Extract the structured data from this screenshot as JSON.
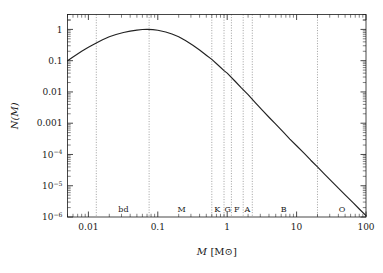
{
  "figure": {
    "name": "stellar-initial-mass-function",
    "background_color": "#ffffff",
    "frame_color": "#1a1a1a",
    "curve_color": "#222222",
    "grid_color": "#777777"
  },
  "axes": {
    "x": {
      "title_symbol": "M",
      "title_unit": "[M⊙]",
      "title_full": "M [M⊙]",
      "scale": "log",
      "min": 0.005,
      "max": 100,
      "tick_labels": [
        "0.01",
        "0.1",
        "1",
        "10",
        "100"
      ],
      "tick_values": [
        0.01,
        0.1,
        1,
        10,
        100
      ]
    },
    "y": {
      "title_full": "N(M)",
      "scale": "log",
      "min": 1e-06,
      "max": 3.0,
      "tick_labels": [
        "1",
        "0.1",
        "0.01",
        "0.001",
        "10−4",
        "10−5",
        "10−6"
      ],
      "tick_values": [
        1,
        0.1,
        0.01,
        0.001,
        0.0001,
        1e-05,
        1e-06
      ],
      "tick_label_parts": [
        {
          "mantissa": "1",
          "exponent": ""
        },
        {
          "mantissa": "0.1",
          "exponent": ""
        },
        {
          "mantissa": "0.01",
          "exponent": ""
        },
        {
          "mantissa": "0.001",
          "exponent": ""
        },
        {
          "mantissa": "10",
          "exponent": "−4"
        },
        {
          "mantissa": "10",
          "exponent": "−5"
        },
        {
          "mantissa": "10",
          "exponent": "−6"
        }
      ]
    }
  },
  "spectral_classes": {
    "labels": [
      "bd",
      "M",
      "K",
      "G",
      "F",
      "A",
      "B",
      "O"
    ],
    "label_mass_positions": [
      0.032,
      0.22,
      0.72,
      1.02,
      1.38,
      1.95,
      6.5,
      45
    ],
    "boundary_masses": [
      0.013,
      0.075,
      0.6,
      0.9,
      1.15,
      1.7,
      2.3,
      20.0
    ],
    "label_y_value": 1.1e-06
  },
  "chart_data": {
    "type": "line",
    "title": "",
    "xlabel": "M [M⊙]",
    "ylabel": "N(M)",
    "xscale": "log",
    "yscale": "log",
    "xlim": [
      0.005,
      100
    ],
    "ylim": [
      1e-06,
      3.0
    ],
    "grid": "vertical-dotted-spectral-class-boundaries",
    "legend": "none",
    "series": [
      {
        "name": "N(M)",
        "description": "lognormal below 1 solar mass, Salpeter power-law slope -2.35 above",
        "peak_mass": 0.07,
        "peak_value": 1.0,
        "powerlaw_slope": -2.35,
        "x": [
          0.005,
          0.006,
          0.008,
          0.01,
          0.013,
          0.016,
          0.02,
          0.025,
          0.032,
          0.04,
          0.05,
          0.06,
          0.07,
          0.085,
          0.1,
          0.13,
          0.16,
          0.2,
          0.25,
          0.32,
          0.4,
          0.5,
          0.6,
          0.75,
          0.9,
          1.0,
          1.3,
          1.6,
          2.0,
          2.5,
          3.2,
          4.0,
          5.0,
          6.5,
          8.0,
          10.0,
          13.0,
          16.0,
          20.0,
          25.0,
          32.0,
          40.0,
          50.0,
          65.0,
          80.0,
          100.0
        ],
        "y": [
          0.1,
          0.132,
          0.2,
          0.27,
          0.37,
          0.47,
          0.58,
          0.69,
          0.8,
          0.88,
          0.95,
          0.99,
          1.0,
          0.98,
          0.94,
          0.83,
          0.71,
          0.58,
          0.44,
          0.31,
          0.22,
          0.15,
          0.11,
          0.07,
          0.048,
          0.04,
          0.022,
          0.0135,
          0.0082,
          0.0047,
          0.0026,
          0.00155,
          0.00093,
          0.00051,
          0.00031,
          0.00019,
          0.000107,
          6.55e-05,
          4e-05,
          2.41e-05,
          1.37e-05,
          8.4e-06,
          5.1e-06,
          2.9e-06,
          1.8e-06,
          1.1e-06
        ]
      }
    ]
  }
}
